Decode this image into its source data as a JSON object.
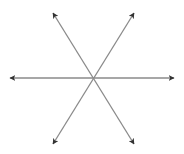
{
  "diagram": {
    "type": "six-arrows-from-center",
    "center": [
      93,
      78
    ],
    "line_color": "#8a8a8a",
    "arrowhead_color": "#333333",
    "background": "#ffffff",
    "lines": [
      {
        "name": "horizontal",
        "from": [
          10,
          78
        ],
        "to": [
          174,
          78
        ]
      },
      {
        "name": "diagonal-rising",
        "from": [
          53,
          144
        ],
        "to": [
          134,
          13
        ]
      },
      {
        "name": "diagonal-falling",
        "from": [
          53,
          13
        ],
        "to": [
          134,
          144
        ]
      }
    ],
    "arrow_tips": [
      {
        "name": "up-left",
        "at": [
          53,
          13
        ]
      },
      {
        "name": "up-right",
        "at": [
          134,
          13
        ]
      },
      {
        "name": "left",
        "at": [
          10,
          78
        ]
      },
      {
        "name": "right",
        "at": [
          174,
          78
        ]
      },
      {
        "name": "down-left",
        "at": [
          53,
          144
        ]
      },
      {
        "name": "down-right",
        "at": [
          134,
          144
        ]
      }
    ]
  }
}
